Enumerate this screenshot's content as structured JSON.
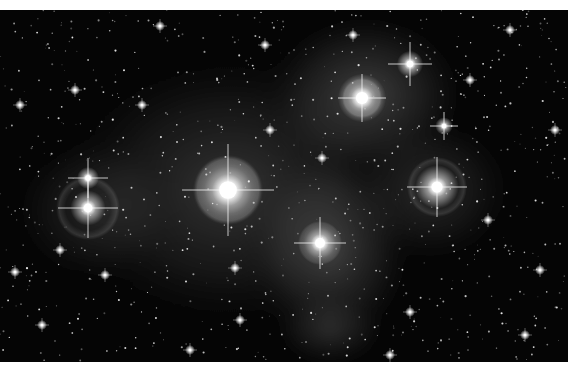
{
  "image": {
    "subject": "Pleiades star cluster (M45) with reflection nebula",
    "width": 568,
    "height": 352,
    "background": "#050505",
    "nebula_color": "#9a9a9a"
  },
  "nebula": [
    {
      "cx": 230,
      "cy": 180,
      "rx": 190,
      "ry": 150,
      "opacity": 0.28
    },
    {
      "cx": 365,
      "cy": 85,
      "rx": 110,
      "ry": 90,
      "opacity": 0.35
    },
    {
      "cx": 330,
      "cy": 240,
      "rx": 90,
      "ry": 110,
      "opacity": 0.32
    },
    {
      "cx": 430,
      "cy": 180,
      "rx": 90,
      "ry": 80,
      "opacity": 0.22
    },
    {
      "cx": 95,
      "cy": 200,
      "rx": 90,
      "ry": 80,
      "opacity": 0.18
    },
    {
      "cx": 330,
      "cy": 320,
      "rx": 60,
      "ry": 40,
      "opacity": 0.2
    }
  ],
  "bright_stars": [
    {
      "name": "alcyone",
      "x": 228,
      "y": 180,
      "r": 16,
      "spike": 46,
      "halo": 34
    },
    {
      "name": "atlas",
      "x": 88,
      "y": 198,
      "r": 8,
      "spike": 30,
      "halo": 32
    },
    {
      "name": "pleione",
      "x": 88,
      "y": 168,
      "r": 5,
      "spike": 20,
      "halo": 0
    },
    {
      "name": "merope",
      "x": 320,
      "y": 233,
      "r": 9,
      "spike": 26,
      "halo": 22
    },
    {
      "name": "electra",
      "x": 437,
      "y": 177,
      "r": 10,
      "spike": 30,
      "halo": 30
    },
    {
      "name": "maia",
      "x": 362,
      "y": 88,
      "r": 11,
      "spike": 24,
      "halo": 20
    },
    {
      "name": "taygeta",
      "x": 410,
      "y": 54,
      "r": 6,
      "spike": 22,
      "halo": 0
    },
    {
      "name": "celaeno",
      "x": 444,
      "y": 116,
      "r": 4,
      "spike": 14,
      "halo": 0
    }
  ],
  "medium_stars": [
    [
      353,
      25
    ],
    [
      265,
      35
    ],
    [
      75,
      80
    ],
    [
      20,
      95
    ],
    [
      42,
      315
    ],
    [
      105,
      265
    ],
    [
      240,
      310
    ],
    [
      510,
      20
    ],
    [
      555,
      120
    ],
    [
      410,
      302
    ],
    [
      525,
      325
    ],
    [
      142,
      95
    ],
    [
      322,
      148
    ],
    [
      235,
      258
    ],
    [
      300,
      360
    ],
    [
      488,
      210
    ],
    [
      190,
      340
    ],
    [
      160,
      16
    ],
    [
      540,
      260
    ],
    [
      15,
      262
    ],
    [
      60,
      240
    ],
    [
      390,
      345
    ],
    [
      270,
      120
    ],
    [
      470,
      70
    ]
  ],
  "faint_star_count": 900,
  "faint_star_seed": 7
}
